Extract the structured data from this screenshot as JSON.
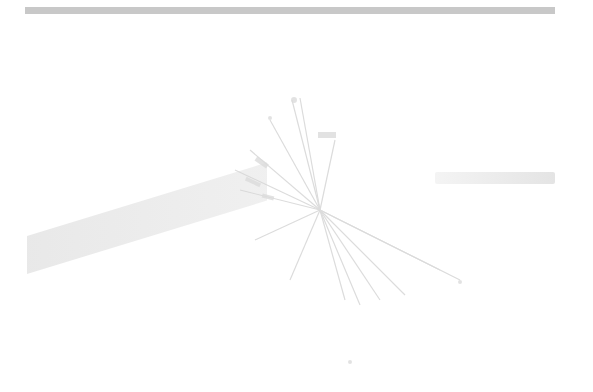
{
  "image": {
    "subject": "overexposed dandelion seed head burst",
    "colors": {
      "background": "#ffffff",
      "top_bar": "#c8c8c8",
      "shadow": "#e6e6e6",
      "detail": "#d2d2d2"
    }
  }
}
